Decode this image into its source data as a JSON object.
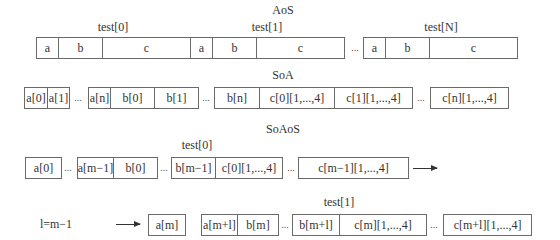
{
  "aos": {
    "title": "AoS",
    "groups": [
      {
        "label": "test[0]",
        "cells": [
          "a",
          "b",
          "c"
        ]
      },
      {
        "label": "test[1]",
        "cells": [
          "a",
          "b",
          "c"
        ]
      },
      {
        "label": "test[N]",
        "cells": [
          "a",
          "b",
          "c"
        ]
      }
    ],
    "ellipsis": "..."
  },
  "soa": {
    "title": "SoA",
    "cells": [
      "a[0]",
      "a[1]",
      "a[n]",
      "b[0]",
      "b[1]",
      "b[n]",
      "c[0][1,...,4]",
      "c[1][1,...,4]",
      "c[n][1,...,4]"
    ],
    "ellipsis": "..."
  },
  "soaos": {
    "title": "SoAoS",
    "block0": {
      "label": "test[0]",
      "cells": [
        "a[0]",
        "a[m−1]",
        "b[0]",
        "b[m−1]",
        "c[0][1,...,4]",
        "c[m−1][1,...,4]"
      ]
    },
    "block1": {
      "label": "test[1]",
      "note": "l=m−1",
      "cells": [
        "a[m]",
        "a[m+l]",
        "b[m]",
        "b[m+l]",
        "c[m][1,...,4]",
        "c[m+l][1,...,4]"
      ]
    },
    "ellipsis": "..."
  }
}
